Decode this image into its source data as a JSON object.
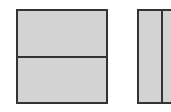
{
  "diagram": {
    "shapes": [
      {
        "id": "left-rectangle",
        "split": "horizontal",
        "parts": 2,
        "fill": "#d3d3d3",
        "stroke": "#333333"
      },
      {
        "id": "right-rectangle",
        "split": "vertical",
        "parts": 2,
        "fill": "#d3d3d3",
        "stroke": "#333333"
      }
    ]
  }
}
